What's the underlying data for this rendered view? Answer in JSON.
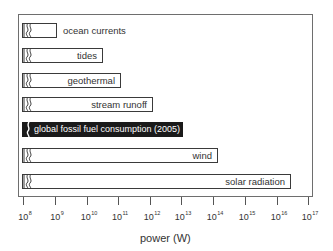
{
  "chart_data": {
    "type": "bar",
    "orientation": "horizontal",
    "scale": "log",
    "title": "",
    "xlabel": "power (W)",
    "ylabel": "",
    "xlim": [
      100000000.0,
      1e+17
    ],
    "x_ticks": [
      "10^8",
      "10^9",
      "10^10",
      "10^11",
      "10^12",
      "10^13",
      "10^14",
      "10^15",
      "10^16",
      "10^17"
    ],
    "grid": false,
    "legend": null,
    "axis_break": true,
    "categories": [
      "ocean currents",
      "tides",
      "geothermal",
      "stream runoff",
      "global fossil fuel consumption (2005)",
      "wind",
      "solar radiation"
    ],
    "values": [
      1100000000.0,
      30000000000.0,
      120000000000.0,
      1200000000000.0,
      12000000000000.0,
      140000000000000.0,
      2.8e+16
    ],
    "highlighted": "global fossil fuel consumption (2005)"
  },
  "bars": [
    {
      "label": "ocean currents",
      "width": 35,
      "top": 23,
      "style": "out"
    },
    {
      "label": "tides",
      "width": 81,
      "top": 48,
      "style": "in"
    },
    {
      "label": "geothermal",
      "width": 99,
      "top": 73,
      "style": "in"
    },
    {
      "label": "stream runoff",
      "width": 131,
      "top": 97,
      "style": "in"
    },
    {
      "label": "global fossil fuel consumption (2005)",
      "width": 161,
      "top": 122,
      "style": "dark"
    },
    {
      "label": "wind",
      "width": 196,
      "top": 148,
      "style": "in"
    },
    {
      "label": "solar radiation",
      "width": 269,
      "top": 174,
      "style": "in"
    }
  ],
  "ticks": [
    {
      "base": "10",
      "exp": "8",
      "x": 23
    },
    {
      "base": "10",
      "exp": "9",
      "x": 55
    },
    {
      "base": "10",
      "exp": "10",
      "x": 87
    },
    {
      "base": "10",
      "exp": "11",
      "x": 118
    },
    {
      "base": "10",
      "exp": "12",
      "x": 150
    },
    {
      "base": "10",
      "exp": "13",
      "x": 181
    },
    {
      "base": "10",
      "exp": "14",
      "x": 213
    },
    {
      "base": "10",
      "exp": "15",
      "x": 245
    },
    {
      "base": "10",
      "exp": "16",
      "x": 277
    },
    {
      "base": "10",
      "exp": "17",
      "x": 308
    }
  ],
  "axis": {
    "xlabel": "power (W)"
  },
  "colors": {
    "highlight": "#1a1a1a",
    "outline": "#3a3a3a",
    "frame": "#6e6e6e"
  }
}
